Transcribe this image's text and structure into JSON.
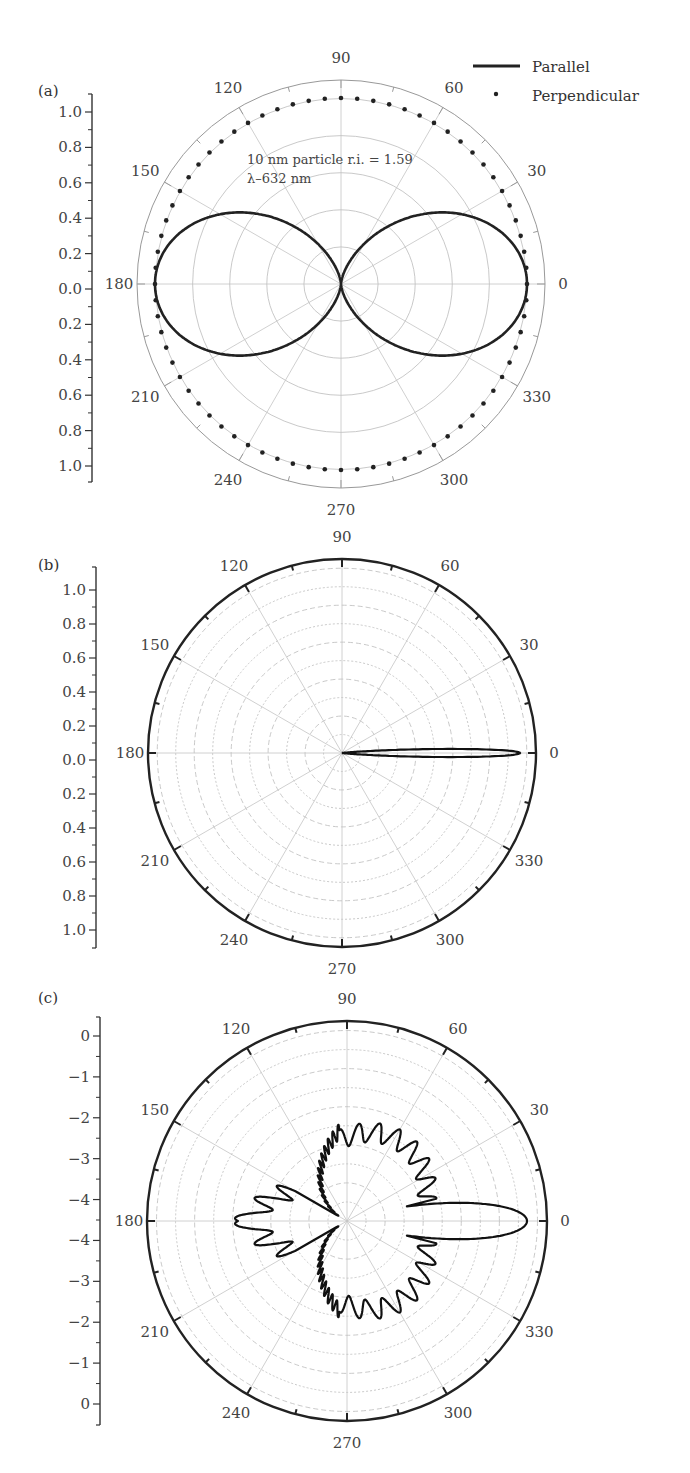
{
  "figure": {
    "panels": [
      {
        "id": "a",
        "label": "(a)"
      },
      {
        "id": "b",
        "label": "(b)"
      },
      {
        "id": "c",
        "label": "(c)"
      }
    ],
    "legend": {
      "parallel": "Parallel",
      "perpendicular": "Perpendicular"
    },
    "annotation": {
      "line1": "10 nm particle r.i. = 1.59",
      "line2": "λ–632 nm"
    },
    "angle_labels": [
      "0",
      "30",
      "60",
      "90",
      "120",
      "150",
      "180",
      "210",
      "240",
      "270",
      "300",
      "330"
    ]
  },
  "chart_data": [
    {
      "panel": "(a)",
      "type": "polar-line",
      "title": "",
      "annotation": "10 nm particle r.i. = 1.59, λ–632 nm",
      "radial_axis": {
        "tick_labels": [
          "1.0",
          "0.8",
          "0.6",
          "0.4",
          "0.2",
          "0.0",
          "0.2",
          "0.4",
          "0.6",
          "0.8",
          "1.0"
        ],
        "range": [
          0,
          1.1
        ]
      },
      "angular_axis": {
        "tick_labels": [
          0,
          30,
          60,
          90,
          120,
          150,
          180,
          210,
          240,
          270,
          300,
          330
        ],
        "unit": "deg"
      },
      "series": [
        {
          "name": "Parallel",
          "style": "solid",
          "description": "dipole figure-eight, r = cos^2(theta)",
          "theta": [
            0,
            30,
            60,
            90,
            120,
            150,
            180,
            210,
            240,
            270,
            300,
            330
          ],
          "r": [
            1.0,
            0.75,
            0.25,
            0.0,
            0.25,
            0.75,
            1.0,
            0.75,
            0.25,
            0.0,
            0.25,
            0.75
          ]
        },
        {
          "name": "Perpendicular",
          "style": "dots",
          "description": "isotropic circle, r ≈ 1.0",
          "theta": [
            0,
            30,
            60,
            90,
            120,
            150,
            180,
            210,
            240,
            270,
            300,
            330
          ],
          "r": [
            1.0,
            1.0,
            1.0,
            1.0,
            1.0,
            1.0,
            1.0,
            1.0,
            1.0,
            1.0,
            1.0,
            1.0
          ]
        }
      ],
      "grid": true,
      "legend_position": "top-right"
    },
    {
      "panel": "(b)",
      "type": "polar-line",
      "radial_axis": {
        "tick_labels": [
          "1.0",
          "0.8",
          "0.6",
          "0.4",
          "0.2",
          "0.0",
          "0.2",
          "0.4",
          "0.6",
          "0.8",
          "1.0"
        ],
        "range": [
          0,
          1.1
        ]
      },
      "angular_axis": {
        "tick_labels": [
          0,
          30,
          60,
          90,
          120,
          150,
          180,
          210,
          240,
          270,
          300,
          330
        ],
        "unit": "deg"
      },
      "series": [
        {
          "name": "Intensity",
          "style": "solid",
          "description": "narrow forward lobe along 0°",
          "theta": [
            0,
            2,
            4,
            6,
            10,
            20,
            90,
            180,
            270,
            340,
            350,
            354,
            356,
            358
          ],
          "r": [
            1.0,
            0.95,
            0.6,
            0.3,
            0.08,
            0.0,
            0.0,
            0.0,
            0.0,
            0.0,
            0.08,
            0.3,
            0.6,
            0.95
          ]
        }
      ],
      "grid": true
    },
    {
      "panel": "(c)",
      "type": "polar-line",
      "radial_axis": {
        "tick_labels": [
          "0",
          "−1",
          "−2",
          "−3",
          "−4",
          "−4",
          "−3",
          "−2",
          "−1",
          "0"
        ],
        "scale": "log10",
        "range": [
          -4.5,
          0.5
        ]
      },
      "angular_axis": {
        "tick_labels": [
          0,
          30,
          60,
          90,
          120,
          150,
          180,
          210,
          240,
          270,
          300,
          330
        ],
        "unit": "deg"
      },
      "series": [
        {
          "name": "Intensity (log)",
          "style": "solid",
          "description": "strong forward lobe at 0°, oscillating side lobes, secondary backscatter lobe at 180°",
          "theta": [
            0,
            10,
            20,
            40,
            60,
            75,
            90,
            120,
            150,
            165,
            180
          ],
          "r_fraction_of_outer": [
            0.9,
            0.3,
            0.4,
            0.45,
            0.45,
            0.48,
            0.4,
            0.3,
            0.1,
            0.35,
            0.51
          ]
        }
      ],
      "grid": true
    }
  ]
}
